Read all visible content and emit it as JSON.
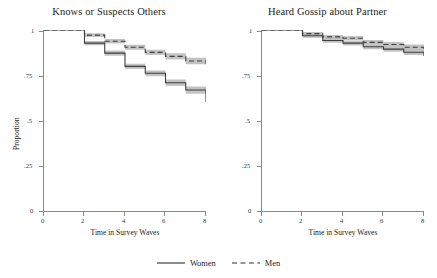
{
  "figure": {
    "xlabel": "Time in Survey Waves",
    "ylabel": "Proportion",
    "legend": {
      "women_label": "Women",
      "men_label": "Men",
      "women_style": "solid",
      "men_style": "dashed"
    }
  },
  "axes": {
    "y_ticks": [
      "0",
      ".25",
      ".5",
      ".75",
      "1"
    ],
    "x_ticks": [
      "0",
      "2",
      "4",
      "6",
      "8"
    ]
  },
  "colors": {
    "line": "#3d3d3d",
    "ci_band": "#b9b9b9",
    "axis": "#8a8a8a",
    "text": "#1d1d1d"
  },
  "chart_data": [
    {
      "type": "line",
      "title": "Knows or Suspects Others",
      "xlabel": "Time in Survey Waves",
      "ylabel": "Proportion",
      "xlim": [
        0,
        8
      ],
      "ylim": [
        0,
        1
      ],
      "x_ticks": [
        0,
        2,
        4,
        6,
        8
      ],
      "y_ticks": [
        0,
        0.25,
        0.5,
        0.75,
        1
      ],
      "grid": false,
      "legend_position": "bottom-outside",
      "step": "post",
      "x": [
        0,
        1,
        2,
        3,
        4,
        5,
        6,
        7,
        8
      ],
      "series": [
        {
          "name": "Women",
          "style": "solid",
          "values": [
            1.0,
            1.0,
            0.928,
            0.873,
            0.8,
            0.762,
            0.71,
            0.67,
            0.605
          ],
          "ci_lower": [
            1.0,
            1.0,
            0.916,
            0.859,
            0.786,
            0.746,
            0.692,
            0.65,
            0.584
          ],
          "ci_upper": [
            1.0,
            1.0,
            0.94,
            0.887,
            0.814,
            0.778,
            0.728,
            0.69,
            0.626
          ]
        },
        {
          "name": "Men",
          "style": "dashed",
          "values": [
            1.0,
            1.0,
            0.972,
            0.938,
            0.905,
            0.877,
            0.855,
            0.83,
            0.812
          ],
          "ci_lower": [
            1.0,
            1.0,
            0.962,
            0.926,
            0.891,
            0.862,
            0.838,
            0.812,
            0.792
          ],
          "ci_upper": [
            1.0,
            1.0,
            0.982,
            0.95,
            0.919,
            0.892,
            0.872,
            0.848,
            0.832
          ]
        }
      ]
    },
    {
      "type": "line",
      "title": "Heard Gossip about Partner",
      "xlabel": "Time in Survey Waves",
      "ylabel": "Proportion",
      "xlim": [
        0,
        8
      ],
      "ylim": [
        0,
        1
      ],
      "x_ticks": [
        0,
        2,
        4,
        6,
        8
      ],
      "y_ticks": [
        0,
        0.25,
        0.5,
        0.75,
        1
      ],
      "grid": false,
      "legend_position": "bottom-outside",
      "step": "post",
      "x": [
        0,
        1,
        2,
        3,
        4,
        5,
        6,
        7,
        8
      ],
      "series": [
        {
          "name": "Women",
          "style": "solid",
          "values": [
            1.0,
            1.0,
            0.968,
            0.942,
            0.928,
            0.908,
            0.895,
            0.878,
            0.857
          ],
          "ci_lower": [
            1.0,
            1.0,
            0.958,
            0.93,
            0.915,
            0.894,
            0.88,
            0.862,
            0.84
          ],
          "ci_upper": [
            1.0,
            1.0,
            0.978,
            0.954,
            0.941,
            0.922,
            0.91,
            0.894,
            0.874
          ]
        },
        {
          "name": "Men",
          "style": "dashed",
          "values": [
            1.0,
            1.0,
            0.98,
            0.962,
            0.955,
            0.932,
            0.92,
            0.905,
            0.888
          ],
          "ci_lower": [
            1.0,
            1.0,
            0.971,
            0.951,
            0.943,
            0.919,
            0.906,
            0.89,
            0.871
          ],
          "ci_upper": [
            1.0,
            1.0,
            0.989,
            0.973,
            0.967,
            0.945,
            0.934,
            0.92,
            0.905
          ]
        }
      ]
    }
  ]
}
